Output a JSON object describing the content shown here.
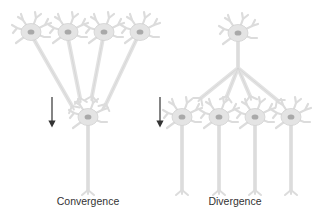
{
  "figure": {
    "panels": [
      {
        "id": "convergence",
        "label": "Convergence",
        "description": "Four presynaptic neurons converge onto one postsynaptic neuron",
        "presynaptic_count": 4,
        "postsynaptic_count": 1
      },
      {
        "id": "divergence",
        "label": "Divergence",
        "description": "One presynaptic neuron diverges onto four postsynaptic neurons",
        "presynaptic_count": 1,
        "postsynaptic_count": 4
      }
    ],
    "arrow_direction": "down",
    "colors": {
      "neuron_fill": "#e4e4e4",
      "neuron_stroke": "#cfcfcf",
      "nucleus": "#a9a9a9",
      "arrow": "#333333",
      "label_text": "#333333",
      "background": "#ffffff"
    }
  }
}
